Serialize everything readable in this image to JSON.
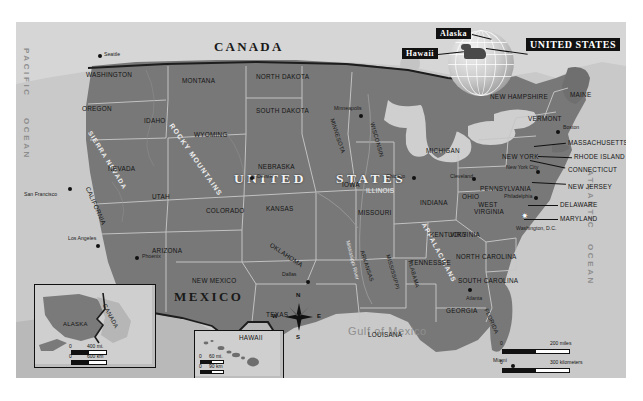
{
  "map": {
    "title_plate": "UNITED STATES",
    "callouts": [
      {
        "label": "Alaska"
      },
      {
        "label": "Hawaii"
      }
    ],
    "big_country_labels": [
      {
        "label": "CANADA"
      },
      {
        "label": "UNITED",
        "note": "left half of UNITED STATES"
      },
      {
        "label": "STATES"
      },
      {
        "label": "MEXICO"
      }
    ],
    "oceans": [
      {
        "label": "PACIFIC"
      },
      {
        "label": "OCEAN"
      },
      {
        "label": "ATLANTIC"
      },
      {
        "label": "OCEAN"
      }
    ],
    "water_bodies": [
      {
        "label": "Gulf of Mexico"
      }
    ],
    "mountain_ranges": [
      {
        "label": "ROCKY MOUNTAINS"
      },
      {
        "label": "SIERRA NEVADA"
      },
      {
        "label": "APPALACHIANS"
      }
    ],
    "rivers": [
      {
        "label": "Mississippi River"
      }
    ],
    "states": [
      {
        "label": "WASHINGTON"
      },
      {
        "label": "OREGON"
      },
      {
        "label": "IDAHO"
      },
      {
        "label": "MONTANA"
      },
      {
        "label": "NORTH DAKOTA"
      },
      {
        "label": "SOUTH DAKOTA"
      },
      {
        "label": "WYOMING"
      },
      {
        "label": "NEVADA"
      },
      {
        "label": "UTAH"
      },
      {
        "label": "COLORADO"
      },
      {
        "label": "NEBRASKA"
      },
      {
        "label": "KANSAS"
      },
      {
        "label": "CALIFORNIA"
      },
      {
        "label": "ARIZONA"
      },
      {
        "label": "NEW MEXICO"
      },
      {
        "label": "OKLAHOMA"
      },
      {
        "label": "TEXAS"
      },
      {
        "label": "MINNESOTA"
      },
      {
        "label": "WISCONSIN"
      },
      {
        "label": "IOWA"
      },
      {
        "label": "MISSOURI"
      },
      {
        "label": "ARKANSAS"
      },
      {
        "label": "LOUISANA"
      },
      {
        "label": "MISSISSIPPI"
      },
      {
        "label": "ALABAMA"
      },
      {
        "label": "ILLINOIS"
      },
      {
        "label": "INDIANA"
      },
      {
        "label": "MICHIGAN"
      },
      {
        "label": "OHIO"
      },
      {
        "label": "KENTUCKY"
      },
      {
        "label": "TENNESSEE"
      },
      {
        "label": "GEORGIA"
      },
      {
        "label": "FLORIDA"
      },
      {
        "label": "SOUTH CAROLINA"
      },
      {
        "label": "NORTH CAROLINA"
      },
      {
        "label": "VIRGINIA"
      },
      {
        "label": "WEST VIRGINIA"
      },
      {
        "label": "PENNSYLVANIA"
      },
      {
        "label": "NEW YORK"
      },
      {
        "label": "MAINE"
      },
      {
        "label": "VERMONT"
      },
      {
        "label": "NEW HAMPSHIRE"
      },
      {
        "label": "MASSACHUSETTS"
      },
      {
        "label": "RHODE ISLAND"
      },
      {
        "label": "CONNECTICUT"
      },
      {
        "label": "NEW JERSEY"
      },
      {
        "label": "DELAWARE"
      },
      {
        "label": "MARYLAND"
      }
    ],
    "cities": [
      {
        "label": "Seattle"
      },
      {
        "label": "San Francisco"
      },
      {
        "label": "Los Angeles"
      },
      {
        "label": "Phoenix"
      },
      {
        "label": "Denver"
      },
      {
        "label": "Dallas"
      },
      {
        "label": "Minneapolis"
      },
      {
        "label": "Chicago"
      },
      {
        "label": "Cleveland"
      },
      {
        "label": "Philadelphia"
      },
      {
        "label": "New York City"
      },
      {
        "label": "Boston"
      },
      {
        "label": "Washington, D.C."
      },
      {
        "label": "Atlanta"
      },
      {
        "label": "Miami"
      }
    ],
    "compass": {
      "n": "N",
      "e": "E",
      "s": "S",
      "w": "W"
    },
    "scale_main": {
      "miles_zero": "0",
      "miles_label": "200 miles",
      "km_zero": "0",
      "km_label": "300  kilometers"
    },
    "inset_alaska": {
      "title": "ALASKA",
      "neighbor": "CANADA",
      "miles_zero": "0",
      "miles_label": "400 mi.",
      "km_zero": "0",
      "km_label": "600 km"
    },
    "inset_hawaii": {
      "title": "HAWAII",
      "miles_zero": "0",
      "miles_label": "60 mi.",
      "km_zero": "0",
      "km_label": "90 km"
    },
    "colors": {
      "usa_land": "#787878",
      "canada_land": "#d6d6d6",
      "mexico_land": "#b9b9b9",
      "ocean": "#c9c9c9",
      "state_border": "#cacaca",
      "national_border": "#1d1d1d",
      "plate_bg": "#111111",
      "plate_fg": "#ffffff"
    }
  }
}
